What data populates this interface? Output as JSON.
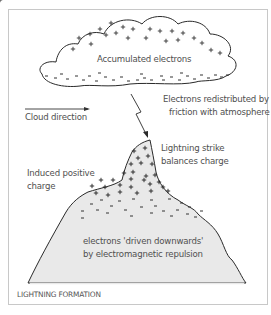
{
  "diagram": {
    "caption": "LIGHTNING FORMATION",
    "labels": {
      "cloud": "Accumulated electrons",
      "redistributed_line1": "Electrons redistributed by",
      "redistributed_line2": "friction with atmosphere",
      "cloud_direction": "Cloud direction",
      "strike_line1": "Lightning strike",
      "strike_line2": "balances charge",
      "induced_line1": "Induced positive",
      "induced_line2": "charge",
      "driven_line1": "electrons 'driven downwards'",
      "driven_line2": "by electromagnetic repulsion"
    },
    "symbols": {
      "positive": "+",
      "negative": "-"
    },
    "colors": {
      "mountain_fill": "#e9e9e9",
      "outline": "#2a2a2a",
      "frame": "#c8c8c8",
      "text": "#505050"
    }
  }
}
